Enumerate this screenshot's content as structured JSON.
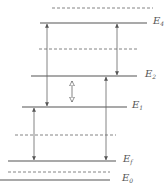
{
  "diagram": {
    "type": "energy-level-diagram",
    "colors": {
      "level_line": "#555555",
      "dashed_line": "#777777",
      "arrow": "#666666",
      "label": "#555555"
    },
    "levels": [
      {
        "id": "E4",
        "symbol": "E",
        "subscript": "4",
        "y": 23,
        "x1": 40,
        "x2": 147,
        "label_x": 153
      },
      {
        "id": "E2",
        "symbol": "E",
        "subscript": "2",
        "y": 76,
        "x1": 31,
        "x2": 137,
        "label_x": 145
      },
      {
        "id": "E1",
        "symbol": "E",
        "subscript": "1",
        "y": 107,
        "x1": 22,
        "x2": 127,
        "label_x": 132
      },
      {
        "id": "Ef",
        "symbol": "E",
        "subscript": "f",
        "y": 161,
        "x1": 8,
        "x2": 116,
        "label_x": 123
      },
      {
        "id": "E0",
        "symbol": "E",
        "subscript": "0",
        "y": 180,
        "x1": 0,
        "x2": 110,
        "label_x": 122
      }
    ],
    "dashed_levels": [
      {
        "y": 8,
        "x1": 52,
        "x2": 153
      },
      {
        "y": 49,
        "x1": 39,
        "x2": 138
      },
      {
        "y": 135,
        "x1": 15,
        "x2": 116
      },
      {
        "y": 172,
        "x1": 8,
        "x2": 110
      }
    ],
    "transitions": [
      {
        "from": "E1",
        "to": "E4",
        "x": 47,
        "style": "solid-double"
      },
      {
        "from": "E2",
        "to": "E4",
        "x": 117,
        "style": "solid-double"
      },
      {
        "from": "E1",
        "to": "E2",
        "x": 72,
        "style": "hollow-double"
      },
      {
        "from": "Ef",
        "to": "E2",
        "x": 106,
        "style": "solid-double"
      },
      {
        "from": "Ef",
        "to": "E1",
        "x": 34,
        "style": "solid-double"
      }
    ]
  }
}
